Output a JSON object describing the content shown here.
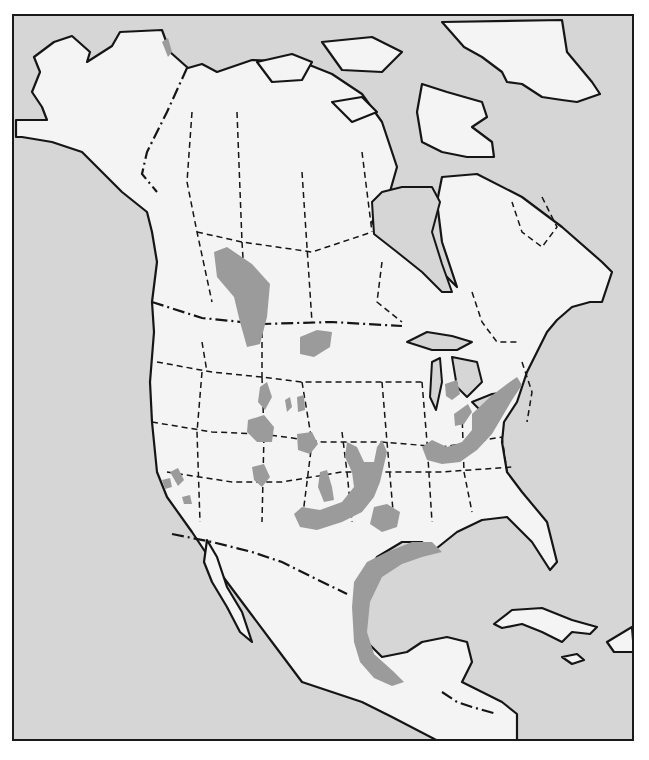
{
  "map": {
    "subject": "North America range map",
    "colors": {
      "water": "#d6d6d6",
      "land": "#f4f4f4",
      "range": "#9b9b9b",
      "outline": "#151515"
    },
    "legend": []
  }
}
